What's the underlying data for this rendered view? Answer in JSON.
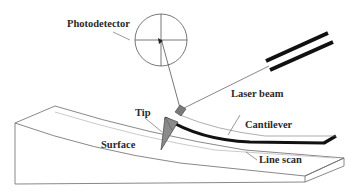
{
  "diagram": {
    "labels": {
      "photodetector": "Photodetector",
      "laser_beam": "Laser beam",
      "tip": "Tip",
      "cantilever": "Cantilever",
      "surface": "Surface",
      "line_scan": "Line scan"
    },
    "colors": {
      "line": "#555555",
      "cantilever": "#111111",
      "tip_fill": "#8a8a8a",
      "mirror_fill": "#7a7a7a",
      "text": "#2a2a2a",
      "background": "#ffffff"
    }
  }
}
